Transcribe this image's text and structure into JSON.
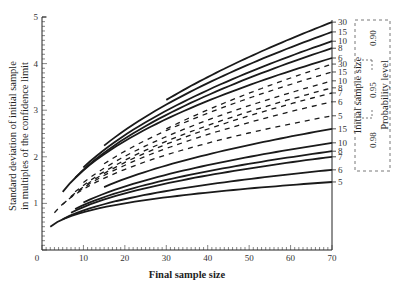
{
  "chart_data": {
    "type": "line",
    "title": "",
    "xlabel": "Final sample size",
    "ylabel_line1": "Standard deviation of initial sample",
    "ylabel_line2": "in multiples of the confidence limit",
    "xlim": [
      0,
      70
    ],
    "ylim": [
      0,
      5
    ],
    "x_ticks": [
      0,
      10,
      20,
      30,
      40,
      50,
      60,
      70
    ],
    "y_ticks": [
      1,
      2,
      3,
      4,
      5
    ],
    "grid": false,
    "right_axis_title": "Initial sample size",
    "legend_title": "Probability level",
    "legend_position": "right",
    "groups": [
      {
        "probability": "0.90",
        "style": "solid",
        "series": [
          {
            "name": "30",
            "x_start": 30,
            "y_start": 3.22,
            "y_end": 4.89
          },
          {
            "name": "15",
            "x_start": 15,
            "y_start": 2.24,
            "y_end": 4.68
          },
          {
            "name": "10",
            "x_start": 10,
            "y_start": 1.77,
            "y_end": 4.48
          },
          {
            "name": "8",
            "x_start": 8,
            "y_start": 1.55,
            "y_end": 4.33
          },
          {
            "name": "6",
            "x_start": 5,
            "y_start": 1.25,
            "y_end": 4.12
          }
        ]
      },
      {
        "probability": "0.95",
        "style": "dashed",
        "series": [
          {
            "name": "30",
            "x_start": 30,
            "y_start": 2.6,
            "y_end": 3.99
          },
          {
            "name": "15",
            "x_start": 15,
            "y_start": 1.85,
            "y_end": 3.82
          },
          {
            "name": "10",
            "x_start": 10,
            "y_start": 1.45,
            "y_end": 3.63
          },
          {
            "name": "8",
            "x_start": 8,
            "y_start": 1.25,
            "y_end": 3.48
          },
          {
            "name": "7",
            "x_start": 7,
            "y_start": 1.15,
            "y_end": 3.37
          },
          {
            "name": "6",
            "x_start": 5,
            "y_start": 0.98,
            "y_end": 3.18
          },
          {
            "name": "5",
            "x_start": 3,
            "y_start": 0.8,
            "y_end": 2.88
          }
        ]
      },
      {
        "probability": "0.98",
        "style": "solid",
        "series": [
          {
            "name": "15",
            "x_start": 15,
            "y_start": 1.35,
            "y_end": 2.6
          },
          {
            "name": "10",
            "x_start": 10,
            "y_start": 1.02,
            "y_end": 2.3
          },
          {
            "name": "8",
            "x_start": 8,
            "y_start": 0.88,
            "y_end": 2.12
          },
          {
            "name": "7",
            "x_start": 7,
            "y_start": 0.8,
            "y_end": 2.0
          },
          {
            "name": "6",
            "x_start": 5,
            "y_start": 0.66,
            "y_end": 1.72
          },
          {
            "name": "5",
            "x_start": 2,
            "y_start": 0.5,
            "y_end": 1.46
          }
        ]
      }
    ]
  },
  "labels": {
    "xlabel": "Final sample size",
    "ylabel_line1": "Standard deviation of initial sample",
    "ylabel_line2": "in multiples of the confidence limit",
    "right_axis_title": "Initial sample size",
    "legend_title": "Probability level",
    "prob_090": "0.90",
    "prob_095": "0.95",
    "prob_098": "0.98"
  }
}
